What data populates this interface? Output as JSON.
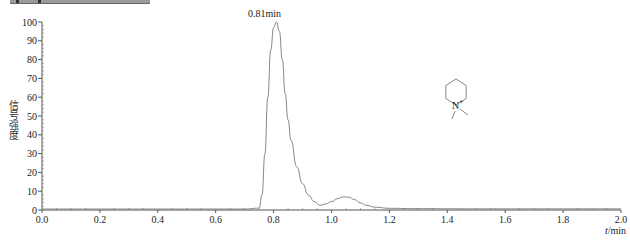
{
  "chart_data": {
    "type": "line",
    "title": "",
    "xlabel": "t/min",
    "ylabel": "信号强度",
    "xlim": [
      0.0,
      2.0
    ],
    "ylim": [
      0,
      100
    ],
    "x_ticks": [
      "0.0",
      "0.2",
      "0.4",
      "0.6",
      "0.8",
      "1.0",
      "1.2",
      "1.4",
      "1.6",
      "1.8",
      "2.0"
    ],
    "y_ticks": [
      "0",
      "10",
      "20",
      "30",
      "40",
      "50",
      "60",
      "70",
      "80",
      "90",
      "100"
    ],
    "grid": false,
    "legend": null,
    "annotations": [
      {
        "text": "0.81min",
        "x": 0.81,
        "y": 100
      },
      {
        "text": "N-methylpiperidinium structure (N+)",
        "x": 1.5,
        "y": 70
      }
    ],
    "series": [
      {
        "name": "chromatogram",
        "x": [
          0.0,
          0.7,
          0.75,
          0.76,
          0.77,
          0.78,
          0.79,
          0.8,
          0.81,
          0.82,
          0.83,
          0.84,
          0.85,
          0.86,
          0.88,
          0.9,
          0.92,
          0.94,
          0.96,
          0.98,
          1.0,
          1.02,
          1.04,
          1.06,
          1.08,
          1.1,
          1.12,
          1.15,
          1.2,
          1.3,
          1.5,
          2.0
        ],
        "y": [
          0.5,
          0.5,
          1,
          8,
          30,
          60,
          85,
          97,
          100,
          95,
          80,
          62,
          48,
          37,
          23,
          14,
          8,
          4.5,
          2.5,
          3.2,
          4.5,
          6,
          7,
          6.8,
          5.5,
          3.8,
          2.5,
          1.5,
          0.9,
          0.7,
          0.6,
          0.6
        ]
      }
    ]
  },
  "labels": {
    "peak": "0.81min",
    "xlabel_var": "t",
    "xlabel_unit": "/min",
    "ylabel": "信号强度",
    "structure_atom": "N",
    "structure_charge": "+"
  }
}
